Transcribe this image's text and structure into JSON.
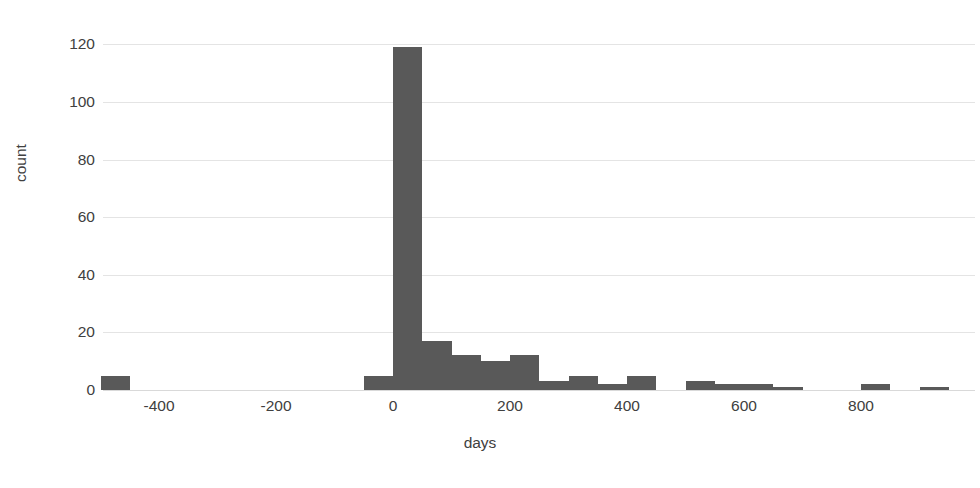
{
  "chart_data": {
    "type": "bar",
    "title": "",
    "subtitle": "",
    "xlabel": "days",
    "ylabel": "count",
    "xlim": [
      -500,
      950
    ],
    "ylim": [
      0,
      125
    ],
    "grid": "horizontal",
    "legend": "none",
    "bin_width": 50,
    "bar_color": "#595959",
    "gridline_color": "#e4e4e4",
    "x_ticks": [
      -400,
      -200,
      0,
      200,
      400,
      600,
      800
    ],
    "x_tick_labels": [
      "-400",
      "-200",
      "0",
      "200",
      "400",
      "600",
      "800"
    ],
    "y_ticks": [
      0,
      20,
      40,
      60,
      80,
      100,
      120
    ],
    "y_tick_labels": [
      "0",
      "20",
      "40",
      "60",
      "80",
      "100",
      "120"
    ],
    "bins": [
      {
        "x0": -500,
        "x1": -450,
        "count": 5
      },
      {
        "x0": -50,
        "x1": 0,
        "count": 5
      },
      {
        "x0": 0,
        "x1": 50,
        "count": 119
      },
      {
        "x0": 50,
        "x1": 100,
        "count": 17
      },
      {
        "x0": 100,
        "x1": 150,
        "count": 12
      },
      {
        "x0": 150,
        "x1": 200,
        "count": 10
      },
      {
        "x0": 200,
        "x1": 250,
        "count": 12
      },
      {
        "x0": 250,
        "x1": 300,
        "count": 3
      },
      {
        "x0": 300,
        "x1": 350,
        "count": 5
      },
      {
        "x0": 350,
        "x1": 400,
        "count": 2
      },
      {
        "x0": 400,
        "x1": 450,
        "count": 5
      },
      {
        "x0": 500,
        "x1": 550,
        "count": 3
      },
      {
        "x0": 550,
        "x1": 600,
        "count": 2
      },
      {
        "x0": 600,
        "x1": 650,
        "count": 2
      },
      {
        "x0": 650,
        "x1": 700,
        "count": 1
      },
      {
        "x0": 800,
        "x1": 850,
        "count": 2
      },
      {
        "x0": 900,
        "x1": 950,
        "count": 1
      }
    ]
  }
}
